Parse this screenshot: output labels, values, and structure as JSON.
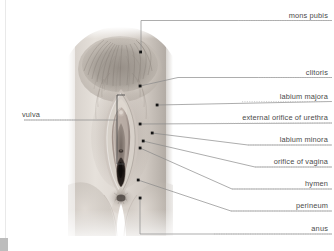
{
  "figure": {
    "kind": "anatomical-illustration",
    "alt": "grayscale photographic rendering of external female genital anatomy",
    "colors": {
      "leader_line": "#7d7d7d",
      "dotted_rule": "#b4b4b4",
      "marker_dot": "#1a1a1a",
      "bracket": "#4d4d4d",
      "text": "#4a4a4a",
      "background": "#ffffff",
      "skin_light": "#e3ded9",
      "skin_mid": "#c6bfb8",
      "skin_shadow": "#8f8880",
      "hair": "#7a736c",
      "inner_dark": "#2b2724"
    }
  },
  "labels_right": [
    {
      "id": "mons-pubis",
      "text": "mons pubis",
      "y": 15
    },
    {
      "id": "clitoris",
      "text": "clitoris",
      "y": 72
    },
    {
      "id": "labium-majora",
      "text": "labium majora",
      "y": 96
    },
    {
      "id": "urethra-orifice",
      "text": "external orifice of urethra",
      "y": 117
    },
    {
      "id": "labium-minora",
      "text": "labium minora",
      "y": 139
    },
    {
      "id": "vagina-orifice",
      "text": "orifice of vagina",
      "y": 161
    },
    {
      "id": "hymen",
      "text": "hymen",
      "y": 183
    },
    {
      "id": "perineum",
      "text": "perineum",
      "y": 205
    },
    {
      "id": "anus",
      "text": "anus",
      "y": 228
    }
  ],
  "labels_left": [
    {
      "id": "vulva",
      "text": "vulva",
      "y": 114
    }
  ],
  "markers": [
    {
      "id": "mons-pubis-dot",
      "x": 141,
      "y": 52
    },
    {
      "id": "clitoris-dot",
      "x": 140,
      "y": 86
    },
    {
      "id": "labium-majora-dot",
      "x": 157,
      "y": 105
    },
    {
      "id": "urethra-dot",
      "x": 140,
      "y": 124
    },
    {
      "id": "labium-minora-dot",
      "x": 152,
      "y": 133
    },
    {
      "id": "vagina-dot",
      "x": 143,
      "y": 141
    },
    {
      "id": "hymen-dot",
      "x": 140,
      "y": 147
    },
    {
      "id": "perineum-dot",
      "x": 138,
      "y": 180
    },
    {
      "id": "anus-dot",
      "x": 140,
      "y": 198
    }
  ],
  "bracket": {
    "id": "vulva-bracket",
    "x": 117,
    "top": 95,
    "bottom": 164,
    "arm": 8
  }
}
